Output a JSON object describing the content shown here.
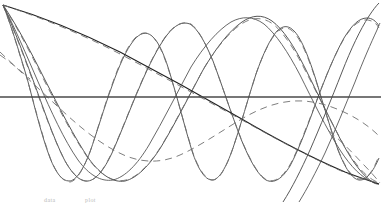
{
  "figure": {
    "title": "",
    "subtitle": "",
    "background_color": "#ffffff",
    "width_px": 381,
    "height_px": 203
  },
  "caption": {
    "fragment_left": "data",
    "fragment_right": "plot"
  },
  "axis": {
    "baseline_y_px": 97,
    "baseline_color": "#4a4a4a",
    "baseline_width_px": 1.4,
    "x_range": [
      0,
      381
    ],
    "y_range": [
      -1.15,
      1.15
    ],
    "grid": false,
    "tick_labels_x": [],
    "tick_labels_y": [],
    "xlabel": "",
    "ylabel": ""
  },
  "style": {
    "solid_color": "#4f4f4f",
    "dashed_color": "#6b6b6b",
    "heavy_color": "#222222",
    "line_width_px": 0.9,
    "dash_pattern": "7 5"
  },
  "legend": {
    "visible": false,
    "position": "none",
    "entries": []
  },
  "chart_data": {
    "type": "line",
    "title": "",
    "subtitle": "",
    "xlabel": "",
    "ylabel": "",
    "xlim": [
      0,
      1
    ],
    "ylim": [
      -1.15,
      1.15
    ],
    "grid": false,
    "legend_position": "none",
    "annotations": [],
    "x_sample_points": [
      0.0,
      0.05,
      0.1,
      0.15,
      0.2,
      0.25,
      0.3,
      0.35,
      0.4,
      0.45,
      0.5,
      0.55,
      0.6,
      0.65,
      0.7,
      0.75,
      0.8,
      0.85,
      0.9,
      0.95,
      1.0
    ],
    "series": [
      {
        "name": "mode-1-solid",
        "style": "solid",
        "color": "#2a2a2a",
        "mode": 1,
        "values": [
          1.0,
          0.9,
          0.8,
          0.7,
          0.6,
          0.5,
          0.4,
          0.3,
          0.2,
          0.1,
          0.0,
          -0.1,
          -0.2,
          -0.3,
          -0.4,
          -0.5,
          -0.6,
          -0.7,
          -0.8,
          -0.9,
          -1.0
        ]
      },
      {
        "name": "mode-1-dashed",
        "style": "dashed",
        "color": "#6b6b6b",
        "mode": 1,
        "values": [
          1.0,
          0.9,
          0.8,
          0.7,
          0.6,
          0.5,
          0.4,
          0.3,
          0.2,
          0.1,
          0.0,
          -0.1,
          -0.2,
          -0.3,
          -0.4,
          -0.5,
          -0.6,
          -0.7,
          -0.8,
          -0.9,
          -1.0
        ]
      },
      {
        "name": "mode-2-solid",
        "style": "solid",
        "color": "#4f4f4f",
        "mode": 2,
        "values": [
          1.0,
          0.69,
          0.31,
          -0.09,
          -0.45,
          -0.72,
          -0.9,
          -0.99,
          -0.97,
          -0.84,
          -0.6,
          -0.29,
          0.06,
          0.42,
          0.71,
          0.9,
          0.99,
          0.95,
          0.78,
          0.5,
          0.14
        ]
      },
      {
        "name": "mode-2-dashed",
        "style": "dashed",
        "color": "#6b6b6b",
        "mode": 2,
        "values": [
          1.0,
          0.66,
          0.27,
          -0.13,
          -0.49,
          -0.75,
          -0.92,
          -0.99,
          -0.95,
          -0.81,
          -0.56,
          -0.24,
          0.11,
          0.46,
          0.74,
          0.92,
          1.0,
          0.93,
          0.75,
          0.46,
          0.1
        ]
      },
      {
        "name": "mode-3-solid",
        "style": "solid",
        "color": "#4f4f4f",
        "mode": 3,
        "values": [
          1.0,
          0.5,
          -0.14,
          -0.71,
          -0.98,
          -0.88,
          -0.42,
          0.21,
          0.76,
          0.99,
          0.83,
          0.33,
          -0.29,
          -0.8,
          -1.0,
          -0.77,
          -0.24,
          0.37,
          0.84,
          0.99,
          0.68
        ]
      },
      {
        "name": "mode-3-dashed",
        "style": "dashed",
        "color": "#6b6b6b",
        "mode": 3,
        "values": [
          1.0,
          0.46,
          -0.19,
          -0.75,
          -0.99,
          -0.84,
          -0.36,
          0.28,
          0.8,
          0.98,
          0.78,
          0.26,
          -0.36,
          -0.84,
          -0.98,
          -0.71,
          -0.17,
          0.44,
          0.88,
          0.97,
          0.62
        ]
      },
      {
        "name": "mode-4-solid",
        "style": "solid",
        "color": "#4f4f4f",
        "mode": 4,
        "values": [
          1.0,
          0.31,
          -0.57,
          -0.99,
          -0.64,
          0.21,
          0.9,
          0.88,
          0.14,
          -0.71,
          -0.99,
          -0.45,
          0.5,
          1.0,
          0.55,
          -0.38,
          -0.97,
          -0.8,
          0.01,
          0.81,
          0.97
        ]
      },
      {
        "name": "mode-4-dashed",
        "style": "dashed",
        "color": "#6b6b6b",
        "mode": 4,
        "values": [
          1.0,
          0.25,
          -0.62,
          -0.98,
          -0.56,
          0.3,
          0.93,
          0.83,
          0.05,
          -0.78,
          -0.97,
          -0.36,
          0.58,
          0.99,
          0.46,
          -0.47,
          -0.99,
          -0.72,
          0.12,
          0.87,
          0.94
        ]
      }
    ]
  }
}
